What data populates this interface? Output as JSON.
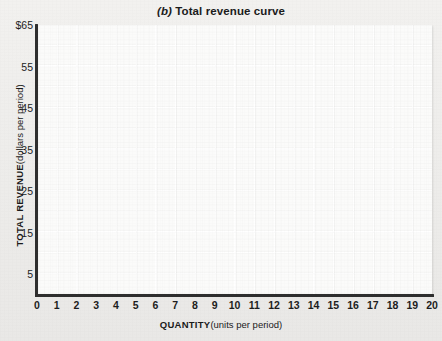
{
  "figure": {
    "panel_letter": "(b)",
    "title": "Total revenue curve",
    "background_color": "#efeeec",
    "plot_background_color": "#fbfbfa",
    "axis_color": "#2f2f2f",
    "grid_color": "#ffffff"
  },
  "chart_data": {
    "type": "line",
    "title": "(b) Total revenue curve",
    "xlabel": "QUANTITY (units per period)",
    "ylabel": "TOTAL REVENUE (dollars per period)",
    "xlabel_bold_part": "QUANTITY",
    "xlabel_light_part": "(units per period)",
    "ylabel_bold_part": "TOTAL REVENUE",
    "ylabel_light_part": "(dollars per period)",
    "xlim": [
      0,
      20
    ],
    "ylim": [
      0,
      65
    ],
    "x_tick_labels": [
      "0",
      "1",
      "2",
      "3",
      "4",
      "5",
      "6",
      "7",
      "8",
      "9",
      "10",
      "11",
      "12",
      "13",
      "14",
      "15",
      "16",
      "17",
      "18",
      "19",
      "20"
    ],
    "x_tick_values": [
      0,
      1,
      2,
      3,
      4,
      5,
      6,
      7,
      8,
      9,
      10,
      11,
      12,
      13,
      14,
      15,
      16,
      17,
      18,
      19,
      20
    ],
    "y_tick_labels": [
      "$65",
      "55",
      "45",
      "35",
      "25",
      "15",
      "5"
    ],
    "y_tick_values": [
      65,
      55,
      45,
      35,
      25,
      15,
      5
    ],
    "x_minor_step": 1,
    "y_minor_step": 5,
    "grid": true,
    "legend": null,
    "series": [],
    "values": [],
    "annotations": [],
    "note": "Blank worksheet grid — no data curve is plotted."
  }
}
